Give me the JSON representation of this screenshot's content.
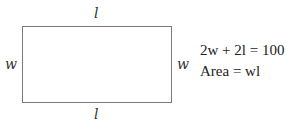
{
  "diagram": {
    "shape": "rectangle",
    "labels": {
      "top": "l",
      "bottom": "l",
      "left": "w",
      "right": "w"
    },
    "equations": [
      "2w + 2l = 100",
      "Area = wl"
    ],
    "colors": {
      "stroke": "#7a7a7a",
      "text": "#222222",
      "background": "#ffffff"
    }
  }
}
